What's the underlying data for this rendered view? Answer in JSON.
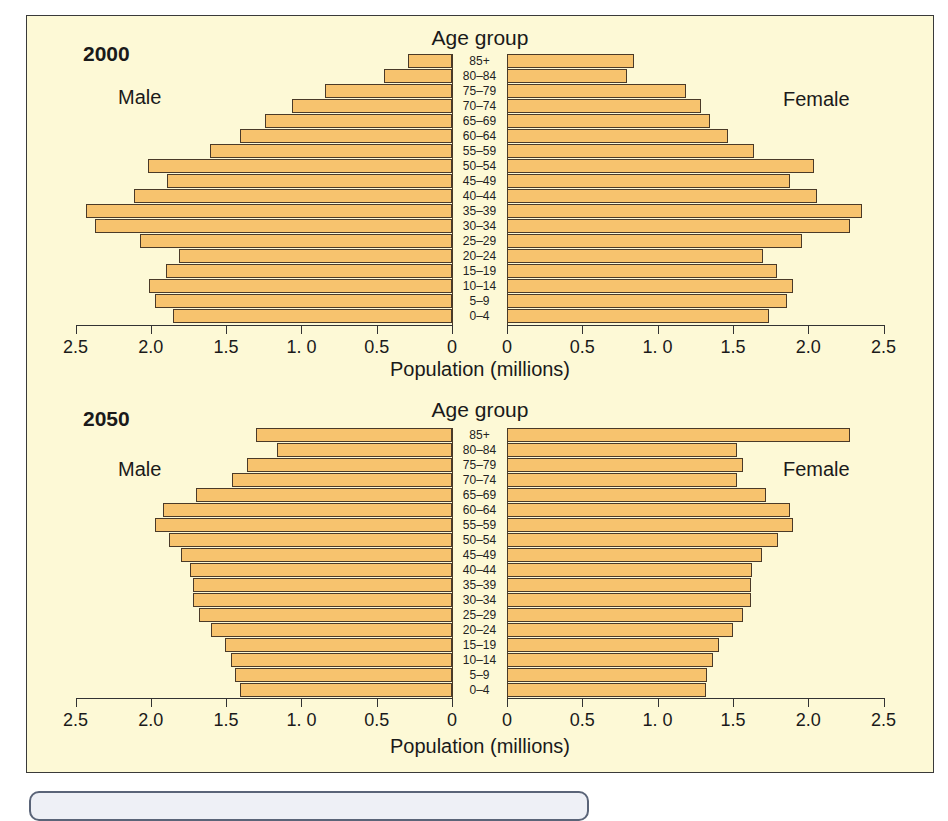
{
  "chart_data": [
    {
      "type": "bar",
      "subtype": "population-pyramid",
      "title": "2000",
      "ylabel": "Age group",
      "xlabel": "Population (millions)",
      "xlim": [
        0,
        2.5
      ],
      "x_ticks": [
        "2.5",
        "2.0",
        "1.5",
        "1. 0",
        "0.5",
        "0",
        "0",
        "0.5",
        "1. 0",
        "1.5",
        "2.0",
        "2.5"
      ],
      "categories": [
        "85+",
        "80–84",
        "75–79",
        "70–74",
        "65–69",
        "60–64",
        "55–59",
        "50–54",
        "45–49",
        "40–44",
        "35–39",
        "30–34",
        "25–29",
        "20–24",
        "15–19",
        "10–14",
        "5–9",
        "0–4"
      ],
      "series": [
        {
          "name": "Male",
          "values": [
            0.29,
            0.45,
            0.84,
            1.06,
            1.24,
            1.41,
            1.61,
            2.02,
            1.89,
            2.11,
            2.43,
            2.37,
            2.07,
            1.81,
            1.9,
            2.01,
            1.97,
            1.85
          ]
        },
        {
          "name": "Female",
          "values": [
            0.84,
            0.8,
            1.19,
            1.29,
            1.35,
            1.47,
            1.64,
            2.04,
            1.88,
            2.06,
            2.36,
            2.28,
            1.96,
            1.7,
            1.79,
            1.9,
            1.86,
            1.74
          ]
        }
      ],
      "grid": false
    },
    {
      "type": "bar",
      "subtype": "population-pyramid",
      "title": "2050",
      "ylabel": "Age group",
      "xlabel": "Population (millions)",
      "xlim": [
        0,
        2.5
      ],
      "x_ticks": [
        "2.5",
        "2.0",
        "1.5",
        "1. 0",
        "0.5",
        "0",
        "0",
        "0.5",
        "1. 0",
        "1.5",
        "2.0",
        "2.5"
      ],
      "categories": [
        "85+",
        "80–84",
        "75–79",
        "70–74",
        "65–69",
        "60–64",
        "55–59",
        "50–54",
        "45–49",
        "40–44",
        "35–39",
        "30–34",
        "25–29",
        "20–24",
        "15–19",
        "10–14",
        "5–9",
        "0–4"
      ],
      "series": [
        {
          "name": "Male",
          "values": [
            1.3,
            1.16,
            1.36,
            1.46,
            1.7,
            1.92,
            1.97,
            1.88,
            1.8,
            1.74,
            1.72,
            1.72,
            1.68,
            1.6,
            1.51,
            1.47,
            1.44,
            1.41
          ]
        },
        {
          "name": "Female",
          "values": [
            2.28,
            1.53,
            1.57,
            1.53,
            1.72,
            1.88,
            1.9,
            1.8,
            1.69,
            1.63,
            1.62,
            1.62,
            1.57,
            1.5,
            1.41,
            1.37,
            1.33,
            1.32
          ]
        }
      ],
      "grid": false
    }
  ],
  "labels": {
    "age_group": "Age group",
    "male": "Male",
    "female": "Female",
    "axis_title": "Population (millions)"
  },
  "colors": {
    "bar_fill": "#f7c36e",
    "bar_stroke": "#4a3a28",
    "panel_bg": "#fdf9d6"
  }
}
